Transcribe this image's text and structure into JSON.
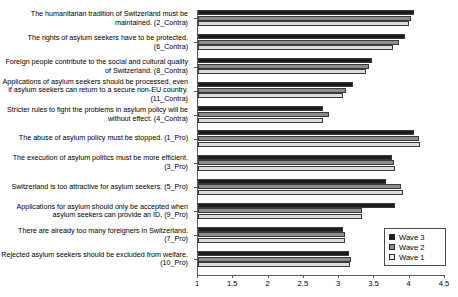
{
  "chart_data": {
    "type": "bar",
    "orientation": "horizontal",
    "title": "",
    "subtitle": "",
    "xlabel": "",
    "ylabel": "",
    "xlim": [
      1,
      4.5
    ],
    "xticks": [
      "1",
      "1.5",
      "2",
      "2.5",
      "3",
      "3.5",
      "4",
      "4.5"
    ],
    "xtick_values": [
      1,
      1.5,
      2,
      2.5,
      3,
      3.5,
      4,
      4.5
    ],
    "grid": false,
    "legend_position": "bottom-right",
    "categories": [
      "The humanitarian tradition of Switzerland must be maintained. (2_Contra)",
      "The rights of asylum seekers have to be protected. (6_Contra)",
      "Foreign people contribute to the social and cultural quality of Switzerland. (8_Contra)",
      "Applications of asylum seekers should be processed, even if asylum seekers can return to a secure non-EU country. (11_Contra)",
      "Stricter rules to fight the problems in asylum policy will be without effect. (4_Contra)",
      "The abuse of asylum policy must be stopped. (1_Pro)",
      "The execution of asylum politics must be more efficient. (3_Pro)",
      "Switzerland is too attractive for asylum seekers. (5_Pro)",
      "Applications for asylum should only be accepted when asylum seekers can provide an ID. (9_Pro)",
      "There are already too many foreigners in Switzerland. (7_Pro)",
      "Rejected asylum seekers should be excluded from welfare. (10_Pro)"
    ],
    "series": [
      {
        "name": "Wave 3",
        "color": "#1c1c1c",
        "values": [
          4.06,
          3.93,
          3.46,
          3.2,
          2.77,
          4.06,
          3.75,
          3.66,
          3.79,
          3.05,
          3.14
        ]
      },
      {
        "name": "Wave 2",
        "color": "#8c8c8c",
        "values": [
          4.02,
          3.85,
          3.42,
          3.1,
          2.85,
          4.13,
          3.78,
          3.87,
          3.33,
          3.09,
          3.17
        ]
      },
      {
        "name": "Wave 1",
        "color": "#dcdcdc",
        "values": [
          3.99,
          3.76,
          3.38,
          3.05,
          2.77,
          4.15,
          3.79,
          3.9,
          3.33,
          3.08,
          3.15
        ]
      }
    ]
  },
  "legend": {
    "items": [
      {
        "label": "Wave 3",
        "swatch": "w3"
      },
      {
        "label": "Wave 2",
        "swatch": "w2"
      },
      {
        "label": "Wave 1",
        "swatch": "w1"
      }
    ]
  }
}
